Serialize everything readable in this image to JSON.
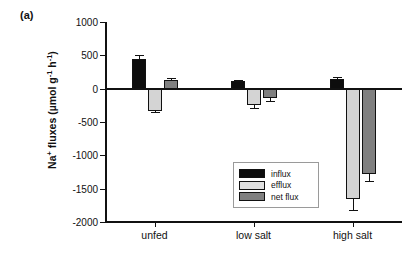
{
  "panel": {
    "label": "(a)"
  },
  "chart_data": {
    "type": "bar",
    "title": "",
    "subtitle": "",
    "xlabel": "",
    "ylabel": "Na+ fluxes (µmol g-1 h-1)",
    "ylabel_parts": {
      "prefix": "Na",
      "charge": "+",
      "mid": " fluxes (µmol g",
      "exp1": "-1",
      "mid2": " h",
      "exp2": "-1",
      "suffix": ")"
    },
    "categories": [
      "unfed",
      "low salt",
      "high salt"
    ],
    "ylim": [
      -2000,
      1000
    ],
    "yticks": [
      1000,
      500,
      0,
      -500,
      -1000,
      -1500,
      -2000
    ],
    "ytick_labels": [
      "1000",
      "500",
      "0",
      "-500",
      "-1000",
      "-1500",
      "-2000"
    ],
    "grid": false,
    "legend_position": "inside-left-lower",
    "series": [
      {
        "name": "influx",
        "color": "#0d0d0d",
        "values": [
          450,
          110,
          150
        ],
        "errors": [
          55,
          20,
          22
        ]
      },
      {
        "name": "efflux",
        "color": "#d4d4d4",
        "values": [
          -330,
          -250,
          -1650
        ],
        "errors": [
          25,
          45,
          175
        ]
      },
      {
        "name": "net flux",
        "color": "#808080",
        "values": [
          130,
          -140,
          -1280
        ],
        "errors": [
          35,
          50,
          100
        ]
      }
    ]
  },
  "legend": {
    "items": [
      {
        "label": "influx",
        "color": "#0d0d0d"
      },
      {
        "label": "efflux",
        "color": "#e0e0e0"
      },
      {
        "label": "net flux",
        "color": "#808080"
      }
    ]
  }
}
